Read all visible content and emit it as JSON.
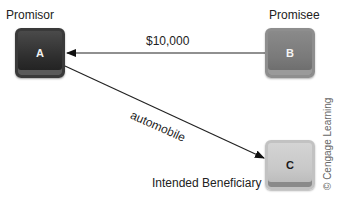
{
  "nodes": {
    "a": {
      "letter": "A",
      "role": "Promisor",
      "color": "#2e2e2e"
    },
    "b": {
      "letter": "B",
      "role": "Promisee",
      "color": "#7a7a7a"
    },
    "c": {
      "letter": "C",
      "role": "Intended Beneficiary",
      "color": "#c8c8c8"
    }
  },
  "edges": [
    {
      "from": "B",
      "to": "A",
      "label": "$10,000"
    },
    {
      "from": "A",
      "to": "C",
      "label": "automobile"
    }
  ],
  "credit": "© Cengage Learning"
}
